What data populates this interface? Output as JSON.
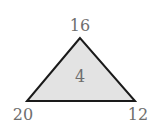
{
  "diagram": {
    "type": "number-triangle",
    "fill_color": "#e3e3e3",
    "stroke_color": "#1a1a1a",
    "label_color": "#6e6e6e",
    "vertices": {
      "top": "16",
      "bottom_left": "20",
      "bottom_right": "12"
    },
    "center": "4"
  }
}
